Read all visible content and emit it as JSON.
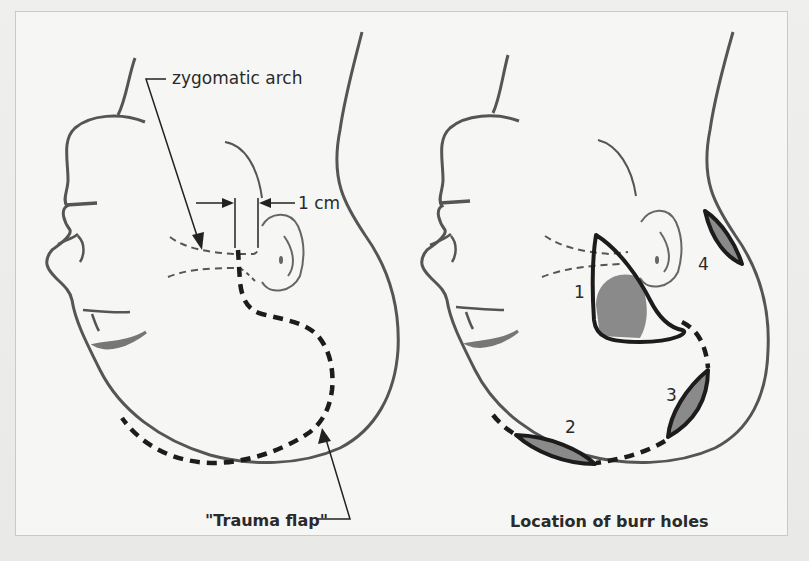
{
  "figure": {
    "left_panel": {
      "caption": "\"Trauma flap\"",
      "labels": {
        "zygomatic_arch": "zygomatic arch",
        "distance": "1 cm"
      }
    },
    "right_panel": {
      "caption": "Location of burr holes",
      "burr_holes": [
        {
          "number": "1"
        },
        {
          "number": "2"
        },
        {
          "number": "3"
        },
        {
          "number": "4"
        }
      ]
    }
  },
  "colors": {
    "outline": "#555555",
    "ink": "#1c1c1c",
    "shade": "#8a8a8a",
    "background": "#f6f6f4"
  }
}
